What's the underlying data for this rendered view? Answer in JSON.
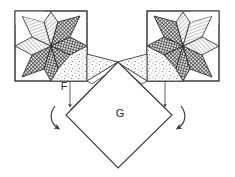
{
  "figure": {
    "kind": "quilting-assembly-diagram",
    "title": "",
    "background_color": "#ffffff",
    "line_color": "#3a3a3a",
    "labels": [
      {
        "id": "F",
        "text": "F",
        "x": 64,
        "y": 86,
        "describes": "small corner flap piece on left block"
      },
      {
        "id": "G",
        "text": "G",
        "x": 120,
        "y": 114,
        "describes": "large center square set on point"
      }
    ],
    "blocks": [
      {
        "name": "left-star-block",
        "x": 15,
        "y": 11,
        "width": 72,
        "height": 70,
        "points": 8,
        "hatch_sequence": [
          "light-diagonal",
          "dark-crosshatch",
          "light-diagonal",
          "dark-crosshatch",
          "light-diagonal",
          "dark-crosshatch",
          "light-diagonal",
          "dark-crosshatch"
        ]
      },
      {
        "name": "right-star-block",
        "x": 147,
        "y": 11,
        "width": 72,
        "height": 70,
        "points": 8,
        "hatch_sequence": [
          "dark-crosshatch",
          "light-diagonal",
          "dark-crosshatch",
          "light-diagonal",
          "dark-crosshatch",
          "light-diagonal",
          "dark-crosshatch",
          "light-diagonal"
        ]
      }
    ],
    "center_piece": {
      "name": "center-diamond-G",
      "label": "G",
      "vertices": [
        [
          118,
          62
        ],
        [
          172,
          115
        ],
        [
          118,
          168
        ],
        [
          66,
          115
        ]
      ],
      "fill": "none"
    },
    "flaps": [
      {
        "name": "left-flap",
        "fill": "stipple"
      },
      {
        "name": "right-flap",
        "fill": "stipple"
      }
    ],
    "arrows": [
      {
        "name": "left-fold-arrow",
        "direction": "counterclockwise-down"
      },
      {
        "name": "right-fold-arrow",
        "direction": "clockwise-down"
      }
    ],
    "fold_guides": [
      {
        "name": "left-fold-guide",
        "x": 70,
        "y1": 81,
        "y2": 108
      },
      {
        "name": "right-fold-guide",
        "x": 165,
        "y1": 81,
        "y2": 108
      }
    ]
  }
}
